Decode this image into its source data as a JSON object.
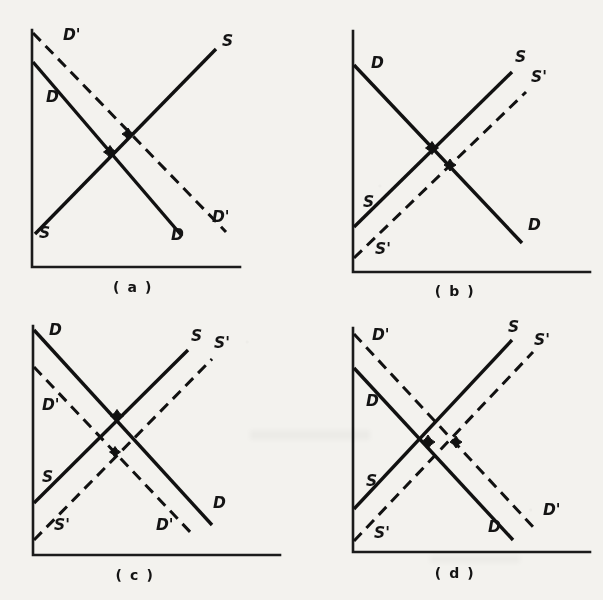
{
  "figure": {
    "background_color": "#f3f2ee",
    "line_color": "#111111",
    "panels": [
      {
        "id": "a",
        "caption": "( a )",
        "description": "Demand increases, supply unchanged",
        "axis": {
          "x": 32,
          "y_top": 30,
          "y_bottom": 267,
          "x_right": 240
        },
        "curves": [
          {
            "name": "D",
            "style": "solid",
            "kind": "demand",
            "x1": 33,
            "y1": 62,
            "x2": 182,
            "y2": 236,
            "label": "D",
            "label_x": 46,
            "label_y": 102
          },
          {
            "name": "D'",
            "style": "dashed",
            "kind": "demand",
            "x1": 33,
            "y1": 33,
            "x2": 226,
            "y2": 232,
            "label": "D'",
            "label_x": 63,
            "label_y": 40
          },
          {
            "name": "S",
            "style": "solid",
            "kind": "supply",
            "x1": 35,
            "y1": 234,
            "x2": 216,
            "y2": 49,
            "label": "S",
            "label_x": 39,
            "label_y": 238
          }
        ],
        "extra_labels": [
          {
            "text": "S",
            "x": 222,
            "y": 46
          },
          {
            "text": "D",
            "x": 171,
            "y": 240
          },
          {
            "text": "D'",
            "x": 212,
            "y": 222
          }
        ],
        "equilibria": [
          {
            "x": 110,
            "y": 152,
            "size": 6.5,
            "note": "original equilibrium D x S"
          },
          {
            "x": 128,
            "y": 134,
            "size": 6.0,
            "note": "new equilibrium D' x S"
          }
        ]
      },
      {
        "id": "b",
        "caption": "( b )",
        "description": "Supply increases, demand unchanged",
        "axis": {
          "x": 353,
          "y_top": 31,
          "y_bottom": 272,
          "x_right": 590
        },
        "curves": [
          {
            "name": "D",
            "style": "solid",
            "kind": "demand",
            "x1": 354,
            "y1": 65,
            "x2": 522,
            "y2": 243,
            "label": "D",
            "label_x": 371,
            "label_y": 68
          },
          {
            "name": "S",
            "style": "solid",
            "kind": "supply",
            "x1": 354,
            "y1": 227,
            "x2": 512,
            "y2": 72,
            "label": "S",
            "label_x": 363,
            "label_y": 207
          },
          {
            "name": "S'",
            "style": "dashed",
            "kind": "supply",
            "x1": 354,
            "y1": 258,
            "x2": 526,
            "y2": 92,
            "label": "S'",
            "label_x": 375,
            "label_y": 254
          }
        ],
        "extra_labels": [
          {
            "text": "S",
            "x": 515,
            "y": 62
          },
          {
            "text": "S'",
            "x": 531,
            "y": 82
          },
          {
            "text": "D",
            "x": 528,
            "y": 230
          }
        ],
        "equilibria": [
          {
            "x": 432,
            "y": 148,
            "size": 6.5,
            "note": "original equilibrium D x S"
          },
          {
            "x": 450,
            "y": 165,
            "size": 6.0,
            "note": "new equilibrium D x S'"
          }
        ]
      },
      {
        "id": "c",
        "caption": "( c )",
        "description": "Demand decreases and supply increases",
        "axis": {
          "x": 33,
          "y_top": 326,
          "y_bottom": 555,
          "x_right": 280
        },
        "curves": [
          {
            "name": "D",
            "style": "solid",
            "kind": "demand",
            "x1": 34,
            "y1": 330,
            "x2": 212,
            "y2": 525,
            "label": "D",
            "label_x": 49,
            "label_y": 335
          },
          {
            "name": "D'",
            "style": "dashed",
            "kind": "demand",
            "x1": 34,
            "y1": 367,
            "x2": 193,
            "y2": 535,
            "label": "D'",
            "label_x": 42,
            "label_y": 410
          },
          {
            "name": "S",
            "style": "solid",
            "kind": "supply",
            "x1": 34,
            "y1": 503,
            "x2": 188,
            "y2": 350,
            "label": "S",
            "label_x": 42,
            "label_y": 482
          },
          {
            "name": "S'",
            "style": "dashed",
            "kind": "supply",
            "x1": 34,
            "y1": 540,
            "x2": 212,
            "y2": 359,
            "label": "S'",
            "label_x": 54,
            "label_y": 530
          }
        ],
        "extra_labels": [
          {
            "text": "S",
            "x": 191,
            "y": 341
          },
          {
            "text": "S'",
            "x": 214,
            "y": 348
          },
          {
            "text": "D",
            "x": 213,
            "y": 508
          },
          {
            "text": "D'",
            "x": 156,
            "y": 530
          }
        ],
        "equilibria": [
          {
            "x": 117,
            "y": 416,
            "size": 6.5,
            "note": "original equilibrium D x S"
          },
          {
            "x": 115,
            "y": 452,
            "size": 5.5,
            "note": "new equilibrium D' x S'"
          }
        ]
      },
      {
        "id": "d",
        "caption": "( d )",
        "description": "Demand increases and supply increases",
        "axis": {
          "x": 353,
          "y_top": 328,
          "y_bottom": 552,
          "x_right": 590
        },
        "curves": [
          {
            "name": "D",
            "style": "solid",
            "kind": "demand",
            "x1": 354,
            "y1": 368,
            "x2": 513,
            "y2": 540,
            "label": "D",
            "label_x": 366,
            "label_y": 406
          },
          {
            "name": "D'",
            "style": "dashed",
            "kind": "demand",
            "x1": 354,
            "y1": 334,
            "x2": 535,
            "y2": 529,
            "label": "D'",
            "label_x": 372,
            "label_y": 340
          },
          {
            "name": "S",
            "style": "solid",
            "kind": "supply",
            "x1": 354,
            "y1": 509,
            "x2": 512,
            "y2": 340,
            "label": "S",
            "label_x": 366,
            "label_y": 486
          },
          {
            "name": "S'",
            "style": "dashed",
            "kind": "supply",
            "x1": 354,
            "y1": 541,
            "x2": 533,
            "y2": 352,
            "label": "S'",
            "label_x": 374,
            "label_y": 538
          }
        ],
        "extra_labels": [
          {
            "text": "S",
            "x": 508,
            "y": 332
          },
          {
            "text": "S'",
            "x": 534,
            "y": 345
          },
          {
            "text": "D",
            "x": 488,
            "y": 532
          },
          {
            "text": "D'",
            "x": 543,
            "y": 515
          }
        ],
        "equilibria": [
          {
            "x": 428,
            "y": 442,
            "size": 7.0,
            "note": "original equilibrium D x S"
          },
          {
            "x": 456,
            "y": 442,
            "size": 6.0,
            "note": "new equilibrium D' x S'"
          }
        ]
      }
    ],
    "captions": [
      {
        "text": "( a )",
        "x": 133,
        "y": 292
      },
      {
        "text": "( b )",
        "x": 455,
        "y": 296
      },
      {
        "text": "( c )",
        "x": 135,
        "y": 580
      },
      {
        "text": "( d )",
        "x": 455,
        "y": 578
      }
    ]
  }
}
